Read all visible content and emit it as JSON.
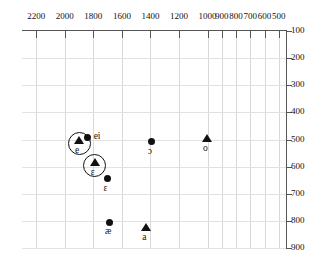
{
  "chart_data": {
    "type": "scatter",
    "title": "",
    "xlabel": "",
    "ylabel": "",
    "xlim": [
      2300,
      450
    ],
    "ylim": [
      100,
      900
    ],
    "x_reversed": true,
    "y_reversed": true,
    "grid": true,
    "legend": "none",
    "x_ticks": [
      2200,
      2000,
      1800,
      1600,
      1400,
      1200,
      1000,
      900,
      800,
      700,
      600,
      500
    ],
    "y_ticks": [
      100,
      200,
      300,
      400,
      500,
      600,
      700,
      800,
      900
    ],
    "x_tick_labels": [
      "2200",
      "2000",
      "1800",
      "1600",
      "1400",
      "1200",
      "1000",
      "900",
      "800",
      "700",
      "600",
      "500"
    ],
    "y_tick_labels": [
      "100",
      "200",
      "300",
      "400",
      "500",
      "600",
      "700",
      "800",
      "900"
    ],
    "points": [
      {
        "label": "e",
        "marker": "triangle",
        "circled": true,
        "label_pos": "below",
        "x": 1900,
        "y": 505
      },
      {
        "label": "ei",
        "marker": "dot",
        "circled": false,
        "label_pos": "right",
        "x": 1840,
        "y": 492
      },
      {
        "label": "ɛ",
        "marker": "triangle",
        "circled": true,
        "label_pos": "below",
        "x": 1790,
        "y": 588
      },
      {
        "label": "ɛ",
        "marker": "dot",
        "circled": false,
        "label_pos": "below",
        "x": 1700,
        "y": 645
      },
      {
        "label": "æ",
        "marker": "dot",
        "circled": false,
        "label_pos": "below",
        "x": 1690,
        "y": 805
      },
      {
        "label": "a",
        "marker": "triangle",
        "circled": false,
        "label_pos": "below",
        "x": 1430,
        "y": 828
      },
      {
        "label": "ɔ",
        "marker": "dot",
        "circled": false,
        "label_pos": "below",
        "x": 1390,
        "y": 508
      },
      {
        "label": "o",
        "marker": "triangle",
        "circled": false,
        "label_pos": "below",
        "x": 1003,
        "y": 498
      }
    ]
  }
}
